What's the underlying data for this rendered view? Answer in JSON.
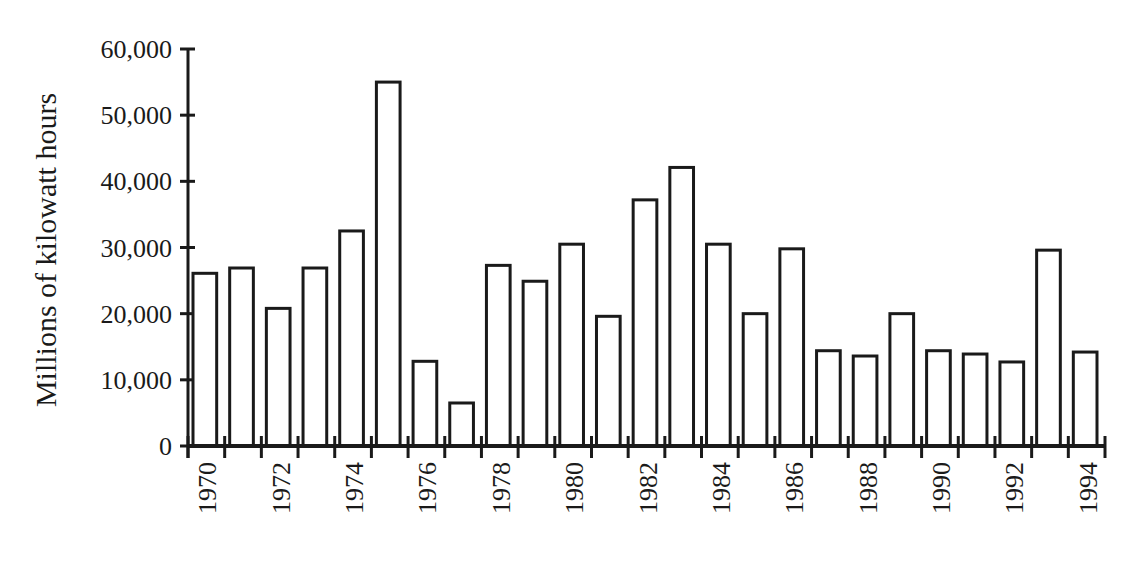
{
  "chart_data": {
    "type": "bar",
    "title": "",
    "xlabel": "",
    "ylabel": "Millions of kilowatt hours",
    "ylim": [
      0,
      60000
    ],
    "yticks": [
      0,
      10000,
      20000,
      30000,
      40000,
      50000,
      60000
    ],
    "ytick_labels": [
      "0",
      "10,000",
      "20,000",
      "30,000",
      "40,000",
      "50,000",
      "60,000"
    ],
    "xtick_labels": [
      "1970",
      "1972",
      "1974",
      "1976",
      "1978",
      "1980",
      "1982",
      "1984",
      "1986",
      "1988",
      "1990",
      "1992",
      "1994"
    ],
    "grid": false,
    "legend": null,
    "bar_style": {
      "fill": "#ffffff",
      "stroke": "#1a1a1a"
    },
    "categories": [
      "1970",
      "1971",
      "1972",
      "1973",
      "1974",
      "1975",
      "1976",
      "1977",
      "1978",
      "1979",
      "1980",
      "1981",
      "1982",
      "1983",
      "1984",
      "1985",
      "1986",
      "1987",
      "1988",
      "1989",
      "1990",
      "1991",
      "1992",
      "1993",
      "1994"
    ],
    "values": [
      26100,
      26900,
      20800,
      26900,
      32500,
      55000,
      12800,
      6500,
      27300,
      24900,
      30500,
      19600,
      37200,
      42100,
      30500,
      20000,
      29800,
      14400,
      13600,
      20000,
      14400,
      13900,
      12700,
      29600,
      14200
    ]
  }
}
